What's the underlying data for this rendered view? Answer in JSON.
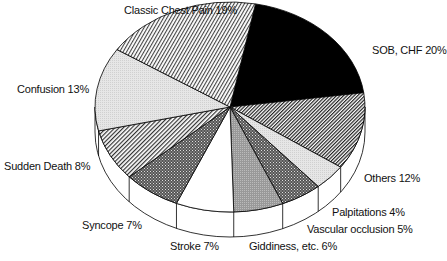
{
  "chart_data": {
    "type": "pie",
    "style": "3d-exploded-none, monochrome hatch patterns",
    "title": "",
    "slices": [
      {
        "label": "SOB, CHF",
        "value": 20,
        "pattern": "solid-black"
      },
      {
        "label": "Others",
        "value": 12,
        "pattern": "diagonal-hatch-dense"
      },
      {
        "label": "Palpitations",
        "value": 4,
        "pattern": "light-gray"
      },
      {
        "label": "Vascular occlusion",
        "value": 5,
        "pattern": "crosshatch-dark"
      },
      {
        "label": "Giddiness, etc.",
        "value": 6,
        "pattern": "gray-stipple"
      },
      {
        "label": "Stroke",
        "value": 7,
        "pattern": "white"
      },
      {
        "label": "Syncope",
        "value": 7,
        "pattern": "crosshatch-dark"
      },
      {
        "label": "Sudden Death",
        "value": 8,
        "pattern": "diagonal-hatch"
      },
      {
        "label": "Confusion",
        "value": 13,
        "pattern": "light-gray"
      },
      {
        "label": "Classic Chest Pain",
        "value": 19,
        "pattern": "diagonal-hatch-vertical"
      }
    ],
    "unit": "%"
  },
  "labels": {
    "chest": "Classic Chest Pain 19%",
    "sob": "SOB, CHF 20%",
    "confusion": "Confusion 13%",
    "sudden": "Sudden Death 8%",
    "syncope": "Syncope 7%",
    "stroke": "Stroke 7%",
    "giddiness": "Giddiness, etc. 6%",
    "vascular": "Vascular occlusion 5%",
    "palpitations": "Palpitations 4%",
    "others": "Others 12%"
  }
}
